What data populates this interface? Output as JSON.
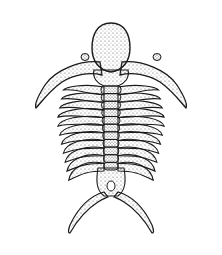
{
  "image": {
    "subject": "trilobite illustration",
    "style": "stippled pen-and-ink scientific drawing",
    "colors": {
      "ink": "#1a1a1a",
      "background": "#ffffff",
      "stipple": "#4a4a4a"
    },
    "thoracic_segments": 11
  }
}
